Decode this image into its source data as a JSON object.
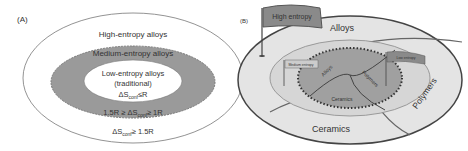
{
  "panelA": {
    "label": "(A)",
    "outer": "High-entropy alloys",
    "middle": "Medium-entropy alloys",
    "inner_line1": "Low-entropy alloys",
    "inner_line2": "(traditional)",
    "inner_cond": "ΔS",
    "inner_cond_sub": "conf",
    "inner_cond_rest": "≤R",
    "middle_cond_pre": "1.5R ≥ ΔS",
    "middle_cond_sub": "conf",
    "middle_cond_rest": "≥ 1R",
    "outer_cond": "ΔS",
    "outer_cond_sub": "conf",
    "outer_cond_rest": "≥ 1.5R"
  },
  "panelB": {
    "label": "(B)",
    "flag_high": "High entropy",
    "flag_medium": "Medium entropy",
    "flag_low": "Low entropy",
    "outer_alloys": "Alloys",
    "outer_polymers": "Polymers",
    "outer_ceramics": "Ceramics",
    "inner_alloys": "Alloys",
    "inner_polymers": "Polymers",
    "inner_ceramics": "Ceramics"
  },
  "colors": {
    "outer_fill": "#e6e6e6",
    "middle_fill": "#8c8c8c",
    "inner_fill": "#bdbdbd",
    "flag_fill": "#8a8a8a",
    "line": "#555555"
  }
}
